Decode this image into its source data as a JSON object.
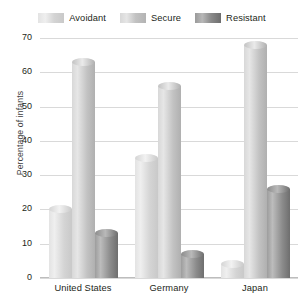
{
  "chart_data": {
    "type": "bar",
    "title": "",
    "xlabel": "",
    "ylabel": "Percentage of infants",
    "ylim": [
      0,
      70
    ],
    "ytick_step": 10,
    "yticks": [
      "70",
      "60",
      "50",
      "40",
      "30",
      "20",
      "10",
      "0"
    ],
    "grid": true,
    "legend_position": "top-center",
    "categories": [
      "United States",
      "Germany",
      "Japan"
    ],
    "series": [
      {
        "name": "Avoidant",
        "values": [
          20,
          35,
          4
        ],
        "color": "#d6d6d6"
      },
      {
        "name": "Secure",
        "values": [
          63,
          56,
          68
        ],
        "color": "#c2c2c2"
      },
      {
        "name": "Resistant",
        "values": [
          13,
          7,
          26
        ],
        "color": "#8e8e8e"
      }
    ]
  },
  "legend": {
    "entries": [
      {
        "label": "Avoidant",
        "swatch": "legend-swatch-avoidant"
      },
      {
        "label": "Secure",
        "swatch": "legend-swatch-secure"
      },
      {
        "label": "Resistant",
        "swatch": "legend-swatch-resistant"
      }
    ]
  },
  "axes": {
    "y": {
      "label": "Percentage of infants",
      "ticks": [
        "70",
        "60",
        "50",
        "40",
        "30",
        "20",
        "10",
        "0"
      ]
    },
    "x": {
      "ticks": [
        "United States",
        "Germany",
        "Japan"
      ]
    }
  },
  "colors": {
    "avoidant_light": "#e9e9e9",
    "avoidant_dark": "#c4c4c4",
    "secure_light": "#dedede",
    "secure_dark": "#ababab",
    "resistant_light": "#b4b4b4",
    "resistant_dark": "#6f6f6f",
    "gridline": "#d9d9d9",
    "background": "#ffffff",
    "text": "#231f20"
  }
}
